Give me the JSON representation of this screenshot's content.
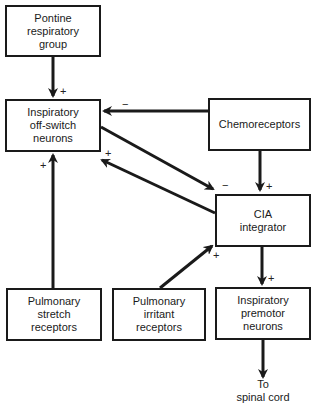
{
  "diagram": {
    "nodes": {
      "pontine": {
        "lines": [
          "Pontine",
          "respiratory",
          "group"
        ]
      },
      "offswitch": {
        "lines": [
          "Inspiratory",
          "off-switch",
          "neurons"
        ]
      },
      "chemo": {
        "lines": [
          "Chemoreceptors"
        ]
      },
      "cia": {
        "lines": [
          "CIA",
          "integrator"
        ]
      },
      "stretch": {
        "lines": [
          "Pulmonary",
          "stretch",
          "receptors"
        ]
      },
      "irritant": {
        "lines": [
          "Pulmonary",
          "irritant",
          "receptors"
        ]
      },
      "premotor": {
        "lines": [
          "Inspiratory",
          "premotor",
          "neurons"
        ]
      }
    },
    "output_note": {
      "lines": [
        "To",
        "spinal cord"
      ]
    },
    "edges": [
      {
        "from": "Pontine respiratory group",
        "to": "Inspiratory off-switch neurons",
        "sign": "+"
      },
      {
        "from": "Chemoreceptors",
        "to": "Inspiratory off-switch neurons",
        "sign": "−"
      },
      {
        "from": "Inspiratory off-switch neurons",
        "to": "CIA integrator",
        "sign": "−"
      },
      {
        "from": "CIA integrator",
        "to": "Inspiratory off-switch neurons",
        "sign": "+"
      },
      {
        "from": "Chemoreceptors",
        "to": "CIA integrator",
        "sign": "+"
      },
      {
        "from": "Pulmonary stretch receptors",
        "to": "Inspiratory off-switch neurons",
        "sign": "+"
      },
      {
        "from": "Pulmonary irritant receptors",
        "to": "CIA integrator",
        "sign": "+"
      },
      {
        "from": "CIA integrator",
        "to": "Inspiratory premotor neurons",
        "sign": "+"
      },
      {
        "from": "Inspiratory premotor neurons",
        "to": "To spinal cord",
        "sign": ""
      }
    ],
    "signs": {
      "pontine_to_offswitch": "+",
      "chemo_to_offswitch": "−",
      "offswitch_to_cia": "−",
      "cia_to_offswitch": "+",
      "chemo_to_cia": "+",
      "stretch_to_offswitch": "+",
      "irritant_to_cia": "+",
      "cia_to_premotor": "+"
    },
    "colors": {
      "line": "#1a1a1a",
      "box_border": "#1a1a1a",
      "background": "#ffffff"
    }
  }
}
